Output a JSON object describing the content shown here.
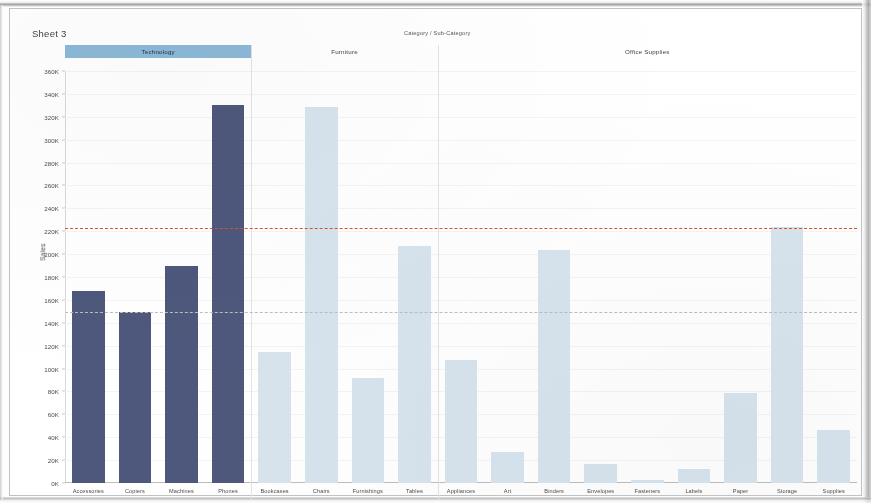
{
  "window": {
    "sheet_title": "Sheet 3",
    "toolbar_ghost_items": [
      "File",
      "Data",
      "Worksheet",
      "Dashboard",
      "Story",
      "Analysis",
      "Map",
      "Format",
      "Server",
      "Window",
      "Help"
    ]
  },
  "colors": {
    "technology_bar": "#4d587c",
    "other_bar": "#d7e4ee",
    "header_highlight": "#8cb9d8",
    "average_line": "#d4552e",
    "median_line": "#bdbdbd"
  },
  "chart_data": {
    "type": "bar",
    "title": "Sheet 3",
    "xlabel": "Category / Sub-Category",
    "ylabel": "Sales",
    "ylim": [
      0,
      360000
    ],
    "ytick_labels": [
      "0K",
      "20K",
      "40K",
      "60K",
      "80K",
      "100K",
      "120K",
      "140K",
      "160K",
      "180K",
      "200K",
      "220K",
      "240K",
      "260K",
      "280K",
      "300K",
      "320K",
      "340K",
      "360K"
    ],
    "ytick_values": [
      0,
      20000,
      40000,
      60000,
      80000,
      100000,
      120000,
      140000,
      160000,
      180000,
      200000,
      220000,
      240000,
      260000,
      280000,
      300000,
      320000,
      340000,
      360000
    ],
    "grid": true,
    "legend": null,
    "groups": [
      {
        "label": "Technology",
        "selected": true
      },
      {
        "label": "Furniture",
        "selected": false
      },
      {
        "label": "Office Supplies",
        "selected": false
      }
    ],
    "categories": [
      "Accessories",
      "Copiers",
      "Machines",
      "Phones",
      "Bookcases",
      "Chairs",
      "Furnishings",
      "Tables",
      "Appliances",
      "Art",
      "Binders",
      "Envelopes",
      "Fasteners",
      "Labels",
      "Paper",
      "Storage",
      "Supplies"
    ],
    "values": [
      167380,
      149528,
      189239,
      330007,
      114880,
      328449,
      91705,
      206966,
      107532,
      27119,
      203413,
      16476,
      3024,
      12486,
      78479,
      223844,
      46674
    ],
    "bar_group": [
      "Technology",
      "Technology",
      "Technology",
      "Technology",
      "Furniture",
      "Furniture",
      "Furniture",
      "Furniture",
      "Office Supplies",
      "Office Supplies",
      "Office Supplies",
      "Office Supplies",
      "Office Supplies",
      "Office Supplies",
      "Office Supplies",
      "Office Supplies",
      "Office Supplies"
    ],
    "reference_lines": [
      {
        "name": "Average",
        "value": 223000,
        "color": "#d4552e",
        "style": "dashed"
      },
      {
        "name": "Median",
        "value": 149000,
        "color": "#bdbdbd",
        "style": "dashed"
      }
    ]
  }
}
